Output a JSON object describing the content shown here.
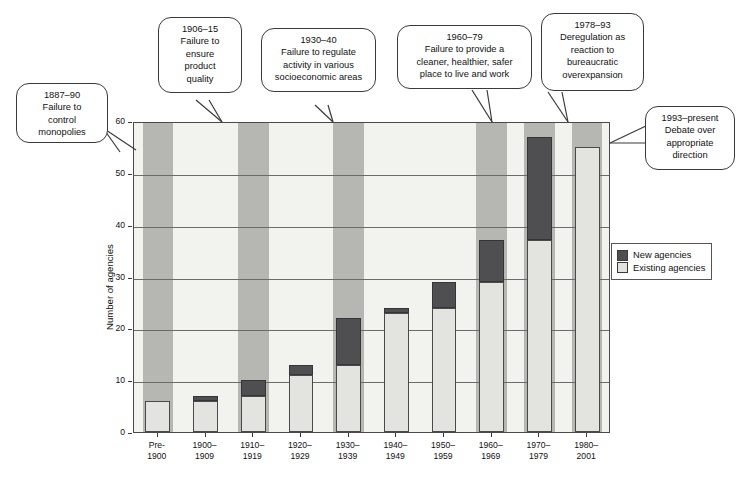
{
  "chart_data": {
    "type": "bar",
    "subtype": "stacked",
    "title": "",
    "xlabel": "",
    "ylabel": "Number of agencies",
    "ylim": [
      0,
      60
    ],
    "yticks": [
      0,
      10,
      20,
      30,
      40,
      50,
      60
    ],
    "grid": true,
    "legend_position": "right",
    "categories": [
      "Pre-\n1900",
      "1900–\n1909",
      "1910–\n1919",
      "1920–\n1929",
      "1930–\n1939",
      "1940–\n1949",
      "1950–\n1959",
      "1960–\n1969",
      "1970–\n1979",
      "1980–\n2001"
    ],
    "series": [
      {
        "name": "Existing agencies",
        "color": "#e3e3df",
        "values": [
          6,
          6,
          7,
          11,
          13,
          23,
          24,
          29,
          37,
          55
        ]
      },
      {
        "name": "New agencies",
        "color": "#4f4f52",
        "values": [
          0,
          1,
          3,
          2,
          9,
          1,
          5,
          8,
          20,
          0
        ]
      }
    ],
    "totals": [
      6,
      7,
      10,
      13,
      22,
      24,
      29,
      37,
      57,
      55
    ],
    "highlight_bands": [
      {
        "start_category": "Pre-\n1900",
        "span": 1
      },
      {
        "start_category": "1910–\n1919",
        "span": 1
      },
      {
        "start_category": "1930–\n1939",
        "span": 1
      },
      {
        "start_category": "1960–\n1969",
        "span": 1
      },
      {
        "start_category": "1970–\n1979",
        "span": 1
      },
      {
        "start_category": "1980–\n2001",
        "span": 1
      }
    ]
  },
  "legend": {
    "items": [
      {
        "label": "New agencies",
        "color": "#4f4f52"
      },
      {
        "label": "Existing agencies",
        "color": "#e3e3df"
      }
    ]
  },
  "callouts": [
    {
      "id": "callout-1887-90",
      "period": "1887–90",
      "text": "Failure to\ncontrol\nmonopolies",
      "full": "1887–90\nFailure to\ncontrol\nmonopolies"
    },
    {
      "id": "callout-1906-15",
      "period": "1906–15",
      "text": "Failure to\nensure\nproduct\nquality",
      "full": "1906–15\nFailure to\nensure\nproduct\nquality"
    },
    {
      "id": "callout-1930-40",
      "period": "1930–40",
      "text": "Failure to regulate\nactivity in various\nsocioeconomic areas",
      "full": "1930–40\nFailure to regulate\nactivity in various\nsocioeconomic areas"
    },
    {
      "id": "callout-1960-79",
      "period": "1960–79",
      "text": "Failure to provide a\ncleaner, healthier, safer\nplace to live and work",
      "full": "1960–79\nFailure to provide a\ncleaner, healthier, safer\nplace to live and work"
    },
    {
      "id": "callout-1978-93",
      "period": "1978–93",
      "text": "Deregulation as\nreaction to\nbureaucratic\noverexpansion",
      "full": "1978–93\nDeregulation as\nreaction to\nbureaucratic\noverexpansion"
    },
    {
      "id": "callout-1993-present",
      "period": "1993–present",
      "text": "Debate over\nappropriate\ndirection",
      "full": "1993–present\nDebate over\nappropriate\ndirection"
    }
  ]
}
